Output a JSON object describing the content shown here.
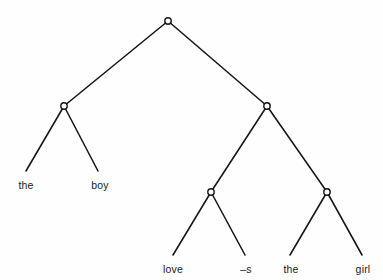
{
  "figure": {
    "type": "syntax-tree-diagram",
    "background_color": "#fefefe",
    "line_color": "#161616",
    "node_fill_color": "#ffffff",
    "text_color": "#1a1a1a"
  },
  "tree": {
    "nodes": [
      {
        "id": "root",
        "x": 168,
        "y": 21,
        "radius": 3.2
      },
      {
        "id": "left-np",
        "x": 64,
        "y": 106,
        "radius": 3.2
      },
      {
        "id": "right-vp",
        "x": 267,
        "y": 106,
        "radius": 3.2
      },
      {
        "id": "verb-node",
        "x": 211,
        "y": 192,
        "radius": 3.2
      },
      {
        "id": "object-np",
        "x": 327,
        "y": 192,
        "radius": 3.2
      }
    ],
    "edges": [
      {
        "id": "root-to-left-np",
        "x1": 168,
        "y1": 21,
        "x2": 64,
        "y2": 106
      },
      {
        "id": "root-to-right-vp",
        "x1": 168,
        "y1": 21,
        "x2": 267,
        "y2": 106
      },
      {
        "id": "left-np-to-the",
        "x1": 64,
        "y1": 106,
        "x2": 26,
        "y2": 171
      },
      {
        "id": "left-np-to-boy",
        "x1": 64,
        "y1": 106,
        "x2": 98,
        "y2": 171
      },
      {
        "id": "right-vp-to-verb-node",
        "x1": 267,
        "y1": 106,
        "x2": 211,
        "y2": 192
      },
      {
        "id": "right-vp-to-object-np",
        "x1": 267,
        "y1": 106,
        "x2": 327,
        "y2": 192
      },
      {
        "id": "verb-node-to-love",
        "x1": 211,
        "y1": 192,
        "x2": 173,
        "y2": 255
      },
      {
        "id": "verb-node-to-suffix",
        "x1": 211,
        "y1": 192,
        "x2": 245,
        "y2": 255
      },
      {
        "id": "object-np-to-the",
        "x1": 327,
        "y1": 192,
        "x2": 290,
        "y2": 255
      },
      {
        "id": "object-np-to-girl",
        "x1": 327,
        "y1": 192,
        "x2": 362,
        "y2": 255
      }
    ],
    "leaves": [
      {
        "id": "leaf-the-1",
        "label": "the",
        "x": 26,
        "y": 180
      },
      {
        "id": "leaf-boy",
        "label": "boy",
        "x": 100,
        "y": 180
      },
      {
        "id": "leaf-love",
        "label": "love",
        "x": 173,
        "y": 264
      },
      {
        "id": "leaf-suffix",
        "label": "–s",
        "x": 246,
        "y": 264
      },
      {
        "id": "leaf-the-2",
        "label": "the",
        "x": 291,
        "y": 264
      },
      {
        "id": "leaf-girl",
        "label": "girl",
        "x": 363,
        "y": 264
      }
    ],
    "sentence": "the boy love–s the girl"
  }
}
